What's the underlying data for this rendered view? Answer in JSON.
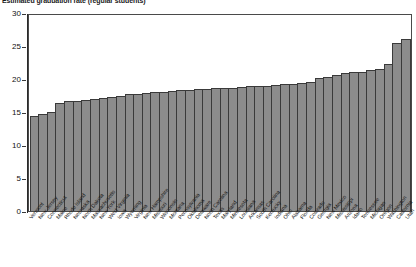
{
  "chart_data": {
    "type": "bar",
    "title": "Estimated graduation rate (regular students)",
    "xlabel": "",
    "ylabel": "",
    "ylim": [
      0,
      30
    ],
    "yticks": [
      0,
      5,
      10,
      15,
      20,
      25,
      30
    ],
    "grid": false,
    "legend": false,
    "bar_color": "#8c8c8c",
    "bar_edge_color": "#3a3a3a",
    "orientation": "vertical",
    "sorted": "ascending",
    "categories": [
      "Vermont",
      "New Jersey",
      "Connecticut",
      "Maine",
      "Rhode Island",
      "Nebraska",
      "North Dakota",
      "Massachusetts",
      "New York",
      "West Virginia",
      "Iowa",
      "Wyoming",
      "Virginia",
      "New Hampshire",
      "Missouri",
      "Wisconsin",
      "Montana",
      "Pennsylvania",
      "Oklahoma",
      "Delaware",
      "North Carolina",
      "Texas",
      "Maryland",
      "Minnesota",
      "Louisiana",
      "Arkansas",
      "South Carolina",
      "Kentucky",
      "Indiana",
      "Ohio",
      "Alabama",
      "Florida",
      "Colorado",
      "Georgia",
      "New Mexico",
      "Mississippi",
      "Arizona",
      "Idaho",
      "Tennessee",
      "Michigan",
      "Oregon",
      "Washington",
      "California",
      "Utah"
    ],
    "values": [
      14.4,
      14.7,
      15.0,
      16.4,
      16.6,
      16.7,
      16.8,
      17.0,
      17.1,
      17.2,
      17.4,
      17.7,
      17.8,
      17.9,
      18.0,
      18.1,
      18.2,
      18.3,
      18.4,
      18.5,
      18.5,
      18.6,
      18.6,
      18.7,
      18.8,
      18.9,
      19.0,
      19.0,
      19.1,
      19.2,
      19.3,
      19.4,
      19.5,
      20.1,
      20.3,
      20.6,
      20.9,
      21.0,
      21.1,
      21.3,
      21.5,
      22.2,
      25.4,
      26.1
    ]
  }
}
